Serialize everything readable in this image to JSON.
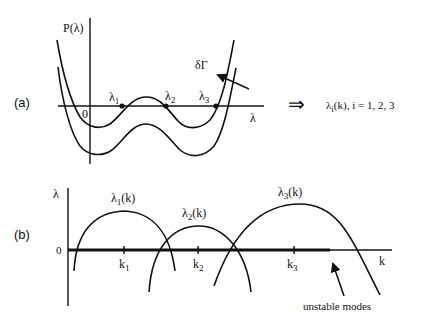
{
  "panel_a": {
    "label": "(a)",
    "y_axis_label": "P(λ)",
    "x_axis_label": "λ",
    "origin_label": "0",
    "roots": [
      {
        "name": "λ",
        "sub": "1"
      },
      {
        "name": "λ",
        "sub": "2"
      },
      {
        "name": "λ",
        "sub": "3"
      }
    ],
    "arrow_label": "δΓ",
    "implication_symbol": "⇒",
    "result_name": "λ",
    "result_sub": "i",
    "result_rest": "(k),  i = 1, 2, 3"
  },
  "panel_b": {
    "label": "(b)",
    "y_axis_label": "λ",
    "x_axis_label": "k",
    "zero_label": "0",
    "curves": [
      {
        "name": "λ",
        "sub": "1",
        "rest": "(k)"
      },
      {
        "name": "λ",
        "sub": "2",
        "rest": "(k)"
      },
      {
        "name": "λ",
        "sub": "3",
        "rest": "(k)"
      }
    ],
    "ticks": [
      {
        "name": "k",
        "sub": "1"
      },
      {
        "name": "k",
        "sub": "2"
      },
      {
        "name": "k",
        "sub": "3"
      }
    ],
    "annotation": "unstable modes"
  }
}
